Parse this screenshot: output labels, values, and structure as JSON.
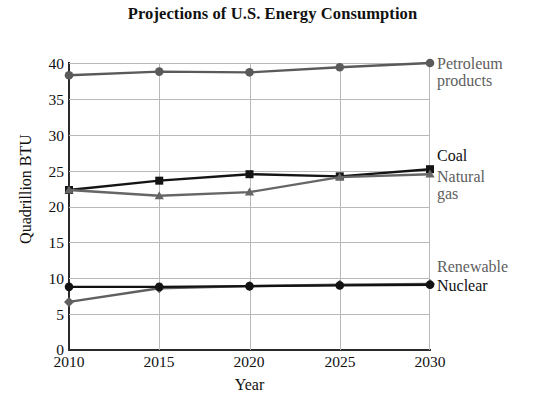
{
  "chart_data": {
    "type": "line",
    "title": "Projections of U.S. Energy Consumption",
    "xlabel": "Year",
    "ylabel": "Quadrillion BTU",
    "categories": [
      "2010",
      "2015",
      "2020",
      "2025",
      "2030"
    ],
    "x": [
      2010,
      2015,
      2020,
      2025,
      2030
    ],
    "xlim": [
      2010,
      2030
    ],
    "ylim": [
      0,
      40
    ],
    "ytick_labels": [
      "0",
      "5",
      "10",
      "15",
      "20",
      "25",
      "30",
      "35",
      "40"
    ],
    "yticks": [
      0,
      5,
      10,
      15,
      20,
      25,
      30,
      35,
      40
    ],
    "grid": "both",
    "legend_position": "right-inline-labels",
    "series": [
      {
        "name": "Petroleum products",
        "label_lines": "Petroleum\nproducts",
        "values": [
          38.3,
          38.8,
          38.7,
          39.4,
          40.0
        ],
        "color": "#5a5a5a",
        "marker": "circle",
        "label_color": "#5e5e5e"
      },
      {
        "name": "Coal",
        "label_lines": "Coal",
        "values": [
          22.3,
          23.6,
          24.5,
          24.2,
          25.2
        ],
        "color": "#141414",
        "marker": "square",
        "label_color": "#111111"
      },
      {
        "name": "Natural gas",
        "label_lines": "Natural\ngas",
        "values": [
          22.3,
          21.5,
          22.0,
          24.1,
          24.5
        ],
        "color": "#666666",
        "marker": "triangle",
        "label_color": "#5e5e5e"
      },
      {
        "name": "Renewable",
        "label_lines": "Renewable",
        "values": [
          6.7,
          8.6,
          8.9,
          9.1,
          9.2
        ],
        "color": "#5f5f5f",
        "marker": "diamond",
        "label_color": "#5e5e5e"
      },
      {
        "name": "Nuclear",
        "label_lines": "Nuclear",
        "values": [
          8.8,
          8.8,
          8.9,
          9.0,
          9.1
        ],
        "color": "#121212",
        "marker": "circle",
        "label_color": "#111111"
      }
    ]
  },
  "labels": {
    "petroleum": "Petroleum\nproducts",
    "coal": "Coal",
    "natural_gas": "Natural\ngas",
    "renewable": "Renewable",
    "nuclear": "Nuclear"
  },
  "ytick_0": "0",
  "ytick_5": "5",
  "ytick_10": "10",
  "ytick_15": "15",
  "ytick_20": "20",
  "ytick_25": "25",
  "ytick_30": "30",
  "ytick_35": "35",
  "ytick_40": "40",
  "xtick_0": "2010",
  "xtick_1": "2015",
  "xtick_2": "2020",
  "xtick_3": "2025",
  "xtick_4": "2030"
}
